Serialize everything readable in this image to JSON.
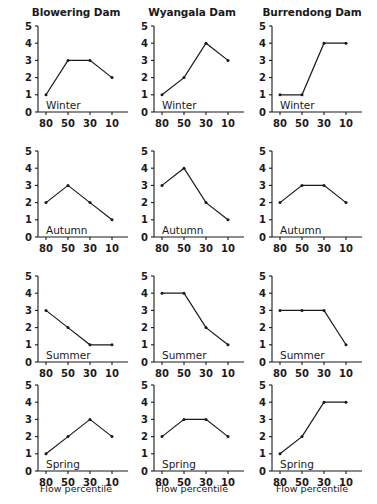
{
  "chart_data": {
    "type": "line",
    "title": "",
    "xlabel": "Flow percentile",
    "ylabel": "",
    "categories": [
      "80",
      "50",
      "30",
      "10"
    ],
    "xticklabels": [
      "80",
      "50",
      "30",
      "10"
    ],
    "yticklabels": [
      "0",
      "1",
      "2",
      "3",
      "4",
      "5"
    ],
    "ylim": [
      0,
      5
    ],
    "grid": false,
    "legend": false,
    "columns": [
      "Blowering Dam",
      "Wyangala Dam",
      "Burrendong Dam"
    ],
    "rows": [
      "Winter",
      "Autumn",
      "Summer",
      "Spring"
    ],
    "panels": [
      {
        "column": "Blowering Dam",
        "row": "Winter",
        "values": [
          1,
          3,
          3,
          2
        ]
      },
      {
        "column": "Wyangala Dam",
        "row": "Winter",
        "values": [
          1,
          2,
          4,
          3
        ]
      },
      {
        "column": "Burrendong Dam",
        "row": "Winter",
        "values": [
          1,
          1,
          4,
          4
        ]
      },
      {
        "column": "Blowering Dam",
        "row": "Autumn",
        "values": [
          2,
          3,
          2,
          1
        ]
      },
      {
        "column": "Wyangala Dam",
        "row": "Autumn",
        "values": [
          3,
          4,
          2,
          1
        ]
      },
      {
        "column": "Burrendong Dam",
        "row": "Autumn",
        "values": [
          2,
          3,
          3,
          2
        ]
      },
      {
        "column": "Blowering Dam",
        "row": "Summer",
        "values": [
          3,
          2,
          1,
          1
        ]
      },
      {
        "column": "Wyangala Dam",
        "row": "Summer",
        "values": [
          4,
          4,
          2,
          1
        ]
      },
      {
        "column": "Burrendong Dam",
        "row": "Summer",
        "values": [
          3,
          3,
          3,
          1
        ]
      },
      {
        "column": "Blowering Dam",
        "row": "Spring",
        "values": [
          1,
          2,
          3,
          2
        ]
      },
      {
        "column": "Wyangala Dam",
        "row": "Spring",
        "values": [
          2,
          3,
          3,
          2
        ]
      },
      {
        "column": "Burrendong Dam",
        "row": "Spring",
        "values": [
          1,
          2,
          4,
          4
        ]
      }
    ],
    "axis_titles": [
      "Flow percentile",
      "Flow percentile",
      "Flow percentile"
    ],
    "colors": {
      "line": "#1a1a1a",
      "axis": "#1a1a1a",
      "background": "#ffffff"
    }
  }
}
